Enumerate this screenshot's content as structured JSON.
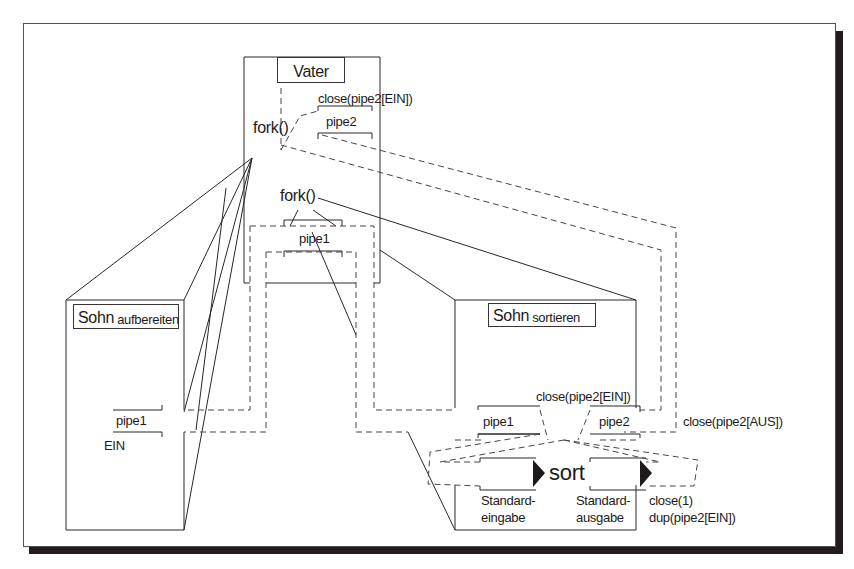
{
  "diagram": {
    "colors": {
      "line": "#2b2626",
      "dashed": "#4a4545",
      "shadow": "#231c1c",
      "background": "#ffffff"
    },
    "father": {
      "title": "Vater",
      "fork_top": "fork()",
      "fork_mid": "fork()",
      "close_label": "close(pipe2[EIN])",
      "pipe2_label": "pipe2",
      "pipe1_label": "pipe1"
    },
    "child_prepare": {
      "title_main": "Sohn",
      "title_sub": "aufbereiten",
      "pipe_label": "pipe1",
      "end_label": "EIN"
    },
    "child_sort": {
      "title_main": "Sohn",
      "title_sub": "sortieren",
      "close_ein_label": "close(pipe2[EIN])",
      "pipe1_label": "pipe1",
      "pipe2_label": "pipe2",
      "close_aus_label": "close(pipe2[AUS])",
      "program_label": "sort",
      "stdin_label_1": "Standard-",
      "stdin_label_2": "eingabe",
      "stdout_label_1": "Standard-",
      "stdout_label_2": "ausgabe",
      "close1_label": "close(1)",
      "dup_label": "dup(pipe2[EIN])"
    }
  }
}
